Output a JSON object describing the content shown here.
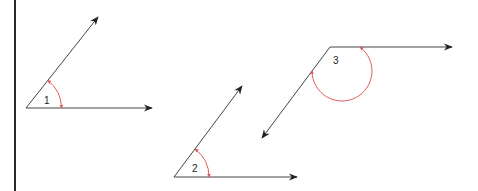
{
  "colors": {
    "background": "#ffffff",
    "line": "#333333",
    "border": "#2a2a2a",
    "arc": "#e05a5a"
  },
  "angles": [
    {
      "label": "1",
      "vertex": [
        26,
        108
      ],
      "ray_a_end": [
        98,
        17
      ],
      "ray_b_end": [
        152,
        108
      ],
      "label_pos": [
        44,
        104
      ]
    },
    {
      "label": "2",
      "vertex": [
        174,
        177
      ],
      "ray_a_end": [
        242,
        86
      ],
      "ray_b_end": [
        297,
        177
      ],
      "label_pos": [
        192,
        172
      ]
    },
    {
      "label": "3",
      "vertex": [
        330,
        47
      ],
      "ray_a_end": [
        452,
        47
      ],
      "ray_b_end": [
        262,
        138
      ],
      "label_pos": [
        333,
        64
      ]
    }
  ]
}
